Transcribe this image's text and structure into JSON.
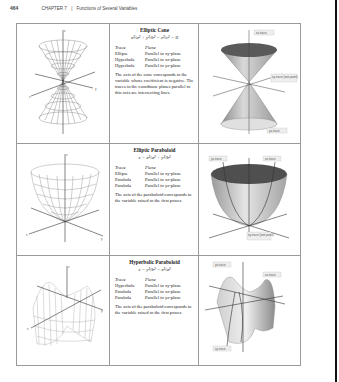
{
  "header": {
    "page_number": "464",
    "chapter": "CHAPTER 7",
    "separator": "|",
    "chapter_title": "Functions of Several Variables"
  },
  "column_heads": {
    "trace": "Trace",
    "plane": "Plane"
  },
  "surfaces": [
    {
      "title": "Elliptic Cone",
      "equation": "x²/a² + y²/b² − z²/c² = 0",
      "traces": [
        {
          "trace": "Ellipse",
          "plane": "Parallel to xy-plane"
        },
        {
          "trace": "Hyperbola",
          "plane": "Parallel to xz-plane"
        },
        {
          "trace": "Hyperbola",
          "plane": "Parallel to yz-plane"
        }
      ],
      "description": "The axis of the cone corresponds to the variable whose coefficient is negative. The traces in the coordinate planes parallel to this axis are intersecting lines.",
      "figure_labels": {
        "top": "xz-trace",
        "middle": "xy-trace (one point)",
        "bottom": "yz-trace"
      }
    },
    {
      "title": "Elliptic Paraboloid",
      "equation": "z = x²/a² + y²/b²",
      "traces": [
        {
          "trace": "Ellipse",
          "plane": "Parallel to xy-plane"
        },
        {
          "trace": "Parabola",
          "plane": "Parallel to xz-plane"
        },
        {
          "trace": "Parabola",
          "plane": "Parallel to yz-plane"
        }
      ],
      "description": "The axis of the paraboloid corresponds to the variable raised to the first power.",
      "figure_labels": {
        "left": "yz-trace",
        "right": "xz-trace",
        "bottom": "xy-trace (one point)"
      }
    },
    {
      "title": "Hyperbolic Paraboloid",
      "equation": "z = y²/b² − x²/a²",
      "traces": [
        {
          "trace": "Hyperbola",
          "plane": "Parallel to xy-plane"
        },
        {
          "trace": "Parabola",
          "plane": "Parallel to xz-plane"
        },
        {
          "trace": "Parabola",
          "plane": "Parallel to yz-plane"
        }
      ],
      "description": "The axis of the paraboloid corresponds to the variable raised to the first power.",
      "figure_labels": {
        "top": "yz-trace",
        "right": "xz-trace",
        "bottom": "xy-trace"
      }
    }
  ],
  "axis_labels": {
    "x": "x",
    "y": "y",
    "z": "z"
  }
}
